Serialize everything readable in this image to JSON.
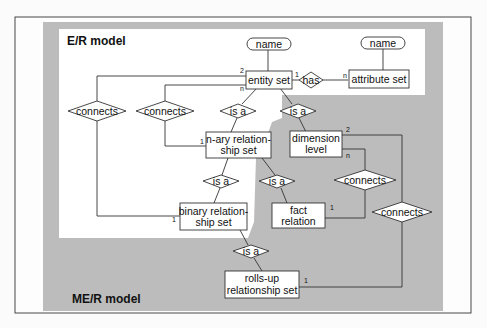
{
  "diagram": {
    "regions": {
      "er_model_label": "E/R model",
      "mer_model_label": "ME/R model"
    },
    "colors": {
      "mer_background": "#b9b9b9",
      "er_background": "#ffffff",
      "frame": "#333333"
    },
    "attributes": [
      {
        "id": "name1",
        "label": "name"
      },
      {
        "id": "name2",
        "label": "name"
      }
    ],
    "entities": [
      {
        "id": "entity_set",
        "lines": [
          "entity set"
        ]
      },
      {
        "id": "attribute_set",
        "lines": [
          "attribute set"
        ]
      },
      {
        "id": "nary_rel",
        "lines": [
          "n-ary relation-",
          "ship set"
        ]
      },
      {
        "id": "binary_rel",
        "lines": [
          "binary relation-",
          "ship set"
        ]
      },
      {
        "id": "dimension_level",
        "lines": [
          "dimension",
          "level"
        ]
      },
      {
        "id": "fact_relation",
        "lines": [
          "fact",
          "relation"
        ]
      },
      {
        "id": "rollsup_rel",
        "lines": [
          "rolls-up",
          "relationship set"
        ]
      }
    ],
    "relationships": [
      {
        "id": "has",
        "label": "has"
      },
      {
        "id": "connects1",
        "label": "connects"
      },
      {
        "id": "connects2",
        "label": "connects"
      },
      {
        "id": "isa1",
        "label": "is a"
      },
      {
        "id": "isa2",
        "label": "is a"
      },
      {
        "id": "isa3",
        "label": "is a"
      },
      {
        "id": "isa4",
        "label": "is a"
      },
      {
        "id": "connects3",
        "label": "connects"
      },
      {
        "id": "connects4",
        "label": "connects"
      },
      {
        "id": "isa5",
        "label": "is a"
      }
    ],
    "cardinalities": {
      "entity_2": "2",
      "entity_n_left": "n",
      "entity_1_has": "1",
      "attr_n": "n",
      "nary_1": "1",
      "binary_1": "1",
      "dim_2": "2",
      "dim_n": "n",
      "fact_1": "1",
      "rollsup_1": "1"
    }
  }
}
